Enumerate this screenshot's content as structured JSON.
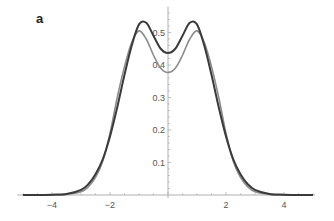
{
  "panel_label": "a",
  "colors": {
    "series_dark": "#3a3a3a",
    "series_gray": "#8c8c8c",
    "axis": "#b0b0b0",
    "tick_text": "#555555"
  },
  "chart_data": {
    "type": "line",
    "title": "",
    "panel": "a",
    "xlabel": "",
    "ylabel": "",
    "xlim": [
      -5.2,
      5.0
    ],
    "ylim": [
      0,
      0.58
    ],
    "xticks": [
      -4,
      -2,
      2,
      4
    ],
    "xtick_labels": [
      "-4",
      "-2",
      "2",
      "4"
    ],
    "yticks": [
      0.1,
      0.2,
      0.3,
      0.4,
      0.5
    ],
    "ytick_labels": [
      "0.1",
      "0.2",
      "0.3",
      "0.4",
      "0.5"
    ],
    "grid": false,
    "legend": null,
    "axes_origin": [
      0,
      0
    ],
    "series": [
      {
        "name": "dark curve",
        "color": "#3a3a3a",
        "x": [
          -5.0,
          -4.5,
          -4.0,
          -3.5,
          -3.0,
          -2.75,
          -2.5,
          -2.25,
          -2.0,
          -1.75,
          -1.5,
          -1.25,
          -1.0,
          -0.75,
          -0.5,
          -0.25,
          0.0,
          0.25,
          0.5,
          0.75,
          1.0,
          1.25,
          1.5,
          1.75,
          2.0,
          2.25,
          2.5,
          2.75,
          3.0,
          3.5,
          4.0,
          4.5,
          5.0
        ],
        "values": [
          0.0,
          0.0,
          0.001,
          0.003,
          0.016,
          0.033,
          0.064,
          0.11,
          0.18,
          0.27,
          0.37,
          0.46,
          0.525,
          0.53,
          0.49,
          0.45,
          0.437,
          0.45,
          0.49,
          0.53,
          0.525,
          0.46,
          0.37,
          0.27,
          0.18,
          0.11,
          0.064,
          0.033,
          0.016,
          0.003,
          0.001,
          0.0,
          0.0
        ]
      },
      {
        "name": "gray curve",
        "color": "#8c8c8c",
        "x": [
          -5.0,
          -4.5,
          -4.0,
          -3.5,
          -3.0,
          -2.75,
          -2.5,
          -2.25,
          -2.0,
          -1.75,
          -1.5,
          -1.25,
          -1.0,
          -0.75,
          -0.5,
          -0.25,
          0.0,
          0.25,
          0.5,
          0.75,
          1.0,
          1.25,
          1.5,
          1.75,
          2.0,
          2.25,
          2.5,
          2.75,
          3.0,
          3.5,
          4.0,
          4.5,
          5.0
        ],
        "values": [
          0.0,
          0.0,
          0.0,
          0.002,
          0.01,
          0.025,
          0.054,
          0.104,
          0.19,
          0.3,
          0.395,
          0.47,
          0.505,
          0.48,
          0.43,
          0.39,
          0.377,
          0.39,
          0.43,
          0.48,
          0.505,
          0.47,
          0.395,
          0.3,
          0.19,
          0.104,
          0.054,
          0.025,
          0.01,
          0.002,
          0.0,
          0.0,
          0.0
        ]
      }
    ]
  }
}
